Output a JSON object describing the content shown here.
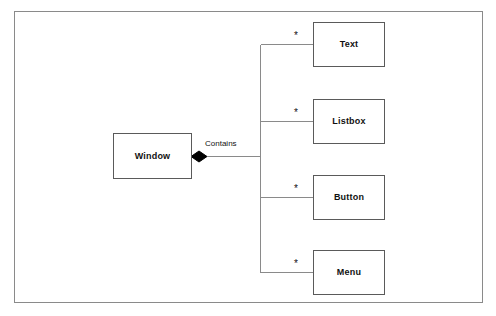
{
  "diagram": {
    "type": "uml-class-composition",
    "title": "",
    "colors": {
      "frame_border": "#8a8a8a",
      "box_border": "#5a5a5a",
      "box_fill": "#ffffff",
      "line": "#8a8a8a",
      "diamond_fill": "#000000",
      "text": "#111111",
      "background": "#ffffff"
    },
    "parent": {
      "label": "Window"
    },
    "association": {
      "label": "Contains",
      "kind": "composition",
      "marker": "filled-diamond"
    },
    "children": [
      {
        "label": "Text",
        "multiplicity": "*"
      },
      {
        "label": "Listbox",
        "multiplicity": "*"
      },
      {
        "label": "Button",
        "multiplicity": "*"
      },
      {
        "label": "Menu",
        "multiplicity": "*"
      }
    ]
  }
}
